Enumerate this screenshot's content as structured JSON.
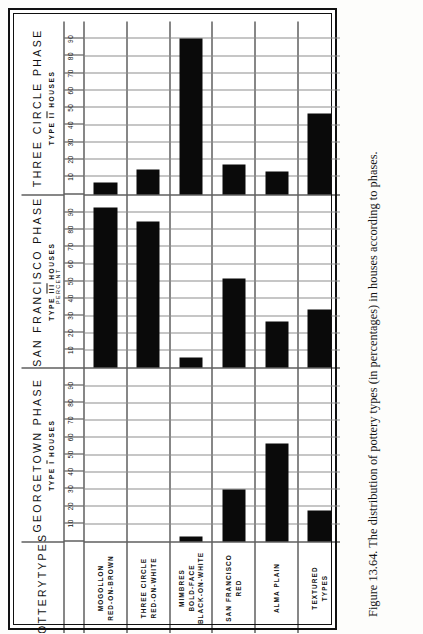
{
  "figure": {
    "caption": "Figure 13.64.  The distribution of pottery types (in percentages) in houses according to phases.",
    "row_header_title_line1": "POTTERY",
    "row_header_title_line2": "TYPES",
    "axis_unit_label": "PERCENT",
    "ink_color": "#0a0a0a",
    "grid_color": "#8e8e8e",
    "frame_color": "#111111"
  },
  "phases": [
    {
      "name": "GEORGETOWN PHASE",
      "sub_prefix": "TYPE",
      "sub_numeral": "I",
      "sub_suffix": "HOUSES"
    },
    {
      "name": "SAN FRANCISCO PHASE",
      "sub_prefix": "TYPE",
      "sub_numeral": "III",
      "sub_suffix": "HOUSES"
    },
    {
      "name": "THREE CIRCLE PHASE",
      "sub_prefix": "TYPE",
      "sub_numeral": "II",
      "sub_suffix": "HOUSES"
    }
  ],
  "pottery_types": [
    {
      "line1": "MOGOLLON",
      "line2": "RED-ON-BROWN",
      "line3": ""
    },
    {
      "line1": "THREE CIRCLE",
      "line2": "RED-ON-WHITE",
      "line3": ""
    },
    {
      "line1": "MIMBRES",
      "line2": "BOLD-FACE",
      "line3": "BLACK-ON-WHITE"
    },
    {
      "line1": "SAN FRANCISCO",
      "line2": "RED",
      "line3": ""
    },
    {
      "line1": "ALMA PLAIN",
      "line2": "",
      "line3": ""
    },
    {
      "line1": "TEXTURED",
      "line2": "TYPES",
      "line3": ""
    }
  ],
  "ticks": [
    "10",
    "20",
    "30",
    "40",
    "50",
    "60",
    "70",
    "80",
    "90"
  ],
  "chart_data": {
    "type": "bar",
    "title": "The distribution of pottery types (in percentages) in houses according to phases",
    "xlabel": "PERCENT",
    "ylabel": "POTTERY TYPES",
    "xlim": [
      0,
      100
    ],
    "grid": true,
    "legend": "none",
    "orientation": "horizontal-panels",
    "categories": [
      "MOGOLLON RED-ON-BROWN",
      "THREE CIRCLE RED-ON-WHITE",
      "MIMBRES BOLD-FACE BLACK-ON-WHITE",
      "SAN FRANCISCO RED",
      "ALMA PLAIN",
      "TEXTURED TYPES"
    ],
    "series": [
      {
        "name": "GEORGETOWN PHASE (TYPE I HOUSES)",
        "values": [
          0,
          0,
          3,
          30,
          57,
          18
        ]
      },
      {
        "name": "SAN FRANCISCO PHASE (TYPE III HOUSES)",
        "values": [
          93,
          85,
          6,
          52,
          27,
          34
        ]
      },
      {
        "name": "THREE CIRCLE PHASE (TYPE II HOUSES)",
        "values": [
          7,
          14,
          90,
          17,
          13,
          47
        ]
      }
    ],
    "tick_values": [
      10,
      20,
      30,
      40,
      50,
      60,
      70,
      80,
      90
    ]
  }
}
